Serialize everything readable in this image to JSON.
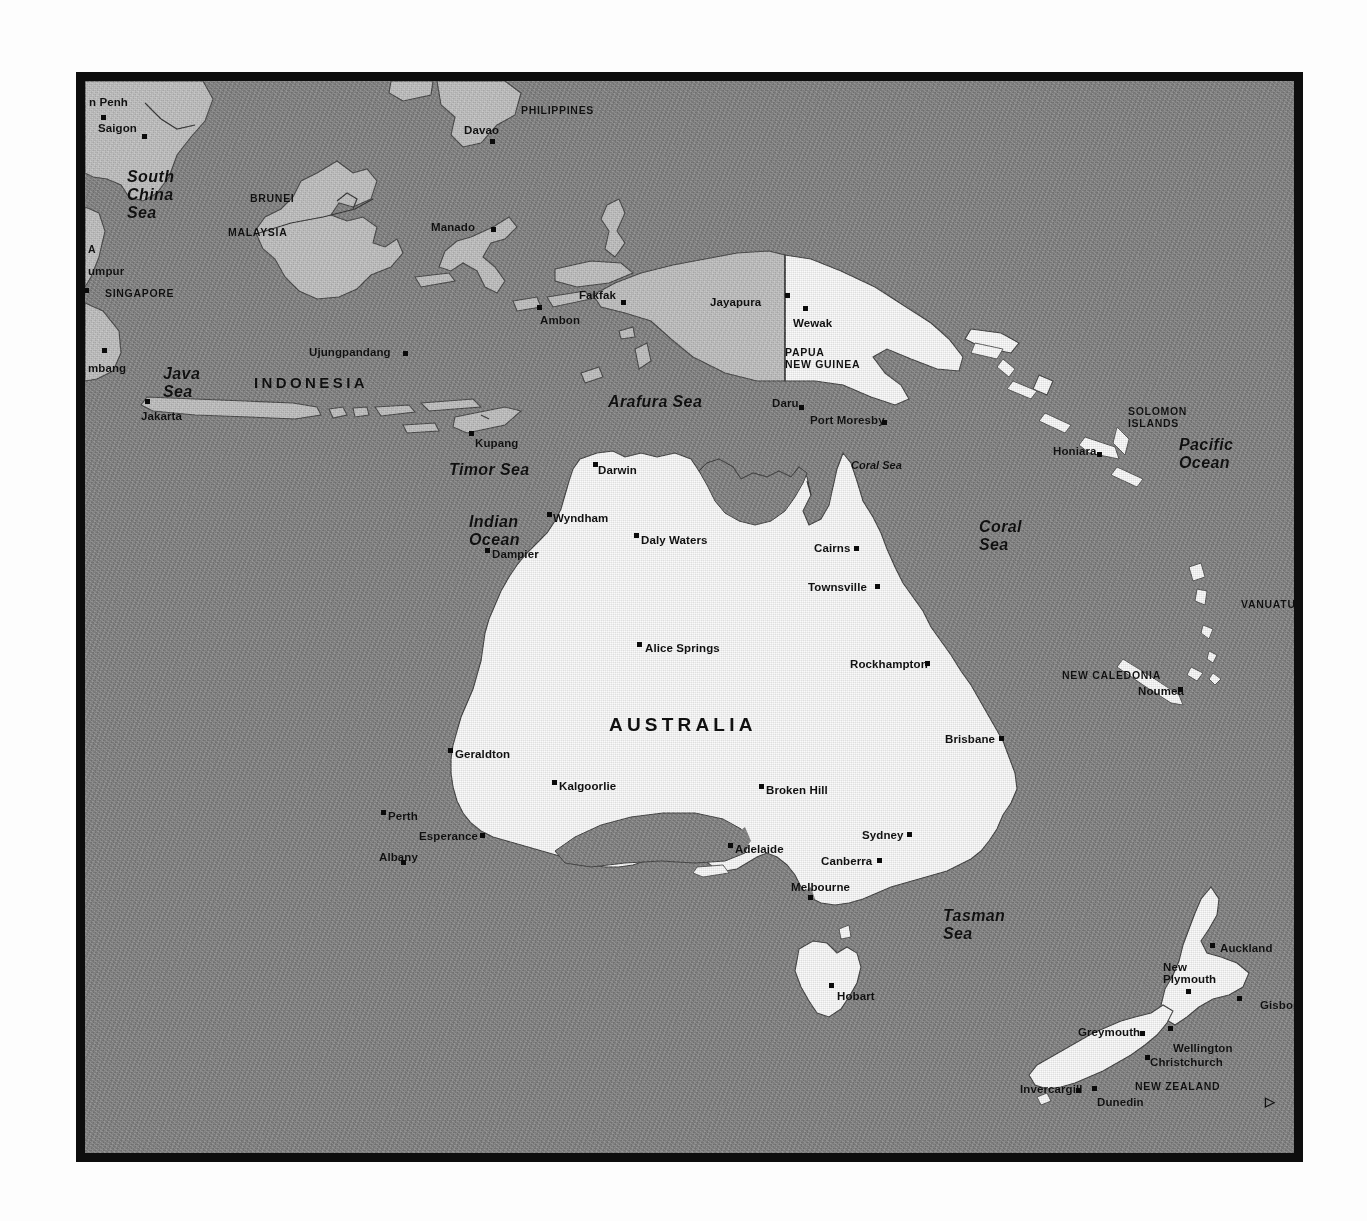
{
  "document": {
    "kind": "printed-map",
    "title": "Australia, Indonesia, Papua New Guinea, New Zealand and the South Pacific",
    "page_background": "#fdfdfd",
    "frame_color": "#0d0d0d",
    "ocean_color": "#898989",
    "land_white_color": "#fbfbfb",
    "land_gray_color": "#c3c3c3"
  },
  "map": {
    "countries": [
      {
        "name": "PHILIPPINES",
        "x": 436,
        "y": 24,
        "style": "country-sm"
      },
      {
        "name": "BRUNEI",
        "x": 165,
        "y": 112,
        "style": "country-sm"
      },
      {
        "name": "MALAYSIA",
        "x": 143,
        "y": 146,
        "style": "country-sm"
      },
      {
        "name": "SINGAPORE",
        "x": 20,
        "y": 207,
        "style": "country-sm"
      },
      {
        "name": "INDONESIA",
        "x": 169,
        "y": 294,
        "style": "country-mid"
      },
      {
        "name": "PAPUA NEW GUINEA",
        "x": 700,
        "y": 266,
        "style": "country-sm multiline",
        "lines": [
          "PAPUA",
          "NEW GUINEA"
        ]
      },
      {
        "name": "SOLOMON ISLANDS",
        "x": 1043,
        "y": 325,
        "style": "country-sm multiline",
        "lines": [
          "SOLOMON",
          "ISLANDS"
        ]
      },
      {
        "name": "VANUATU",
        "x": 1156,
        "y": 518,
        "style": "country-sm"
      },
      {
        "name": "NEW CALEDONIA",
        "x": 977,
        "y": 589,
        "style": "country-sm"
      },
      {
        "name": "AUSTRALIA",
        "x": 524,
        "y": 634,
        "style": "country-big"
      },
      {
        "name": "NEW ZEALAND",
        "x": 1050,
        "y": 1000,
        "style": "country-sm"
      }
    ],
    "seas": [
      {
        "name": "South China Sea",
        "lines": [
          "South",
          "China",
          "Sea"
        ],
        "x": 42,
        "y": 87,
        "style": "sea multiline"
      },
      {
        "name": "Java Sea",
        "lines": [
          "Java",
          "Sea"
        ],
        "x": 78,
        "y": 284,
        "style": "sea multiline"
      },
      {
        "name": "Arafura Sea",
        "lines": [
          "Arafura Sea"
        ],
        "x": 523,
        "y": 313,
        "style": "sea"
      },
      {
        "name": "Pacific Ocean",
        "lines": [
          "Pacific",
          "Ocean"
        ],
        "x": 1094,
        "y": 355,
        "style": "sea multiline"
      },
      {
        "name": "Timor Sea",
        "lines": [
          "Timor Sea"
        ],
        "x": 364,
        "y": 381,
        "style": "sea"
      },
      {
        "name": "Indian Ocean",
        "lines": [
          "Indian",
          "Ocean"
        ],
        "x": 384,
        "y": 432,
        "style": "sea multiline"
      },
      {
        "name": "Coral Sea small",
        "lines": [
          "Coral Sea"
        ],
        "x": 766,
        "y": 379,
        "style": "sea-sm"
      },
      {
        "name": "Coral Sea",
        "lines": [
          "Coral",
          "Sea"
        ],
        "x": 894,
        "y": 437,
        "style": "sea multiline"
      },
      {
        "name": "Tasman Sea",
        "lines": [
          "Tasman",
          "Sea"
        ],
        "x": 858,
        "y": 826,
        "style": "sea multiline"
      }
    ],
    "cities": [
      {
        "name": "Phnom Penh",
        "label": "n Penh",
        "lx": 4,
        "ly": 16,
        "dx": 16,
        "dy": 34,
        "align": "left"
      },
      {
        "name": "Saigon",
        "label": "Saigon",
        "lx": 13,
        "ly": 42,
        "dx": 57,
        "dy": 53,
        "align": "left"
      },
      {
        "name": "Kuala Lumpur",
        "label": "umpur",
        "lx": 3,
        "ly": 185,
        "dx": -1,
        "dy": 207,
        "align": "left"
      },
      {
        "name": "Palembang",
        "label": "mbang",
        "lx": 3,
        "ly": 282,
        "dx": 17,
        "dy": 267,
        "align": "left"
      },
      {
        "name": "Davao",
        "label": "Davao",
        "lx": 379,
        "ly": 44,
        "dx": 405,
        "dy": 58,
        "align": "left"
      },
      {
        "name": "Manado",
        "label": "Manado",
        "lx": 346,
        "ly": 141,
        "dx": 406,
        "dy": 146,
        "align": "left"
      },
      {
        "name": "Ujungpandang",
        "label": "Ujungpandang",
        "lx": 224,
        "ly": 266,
        "dx": 318,
        "dy": 270,
        "align": "left"
      },
      {
        "name": "Jakarta",
        "label": "Jakarta",
        "lx": 56,
        "ly": 330,
        "dx": 60,
        "dy": 318,
        "align": "left"
      },
      {
        "name": "Fakfak",
        "label": "Fakfak",
        "lx": 494,
        "ly": 209,
        "dx": 536,
        "dy": 219,
        "align": "left"
      },
      {
        "name": "Ambon",
        "label": "Ambon",
        "lx": 455,
        "ly": 234,
        "dx": 452,
        "dy": 224,
        "align": "left"
      },
      {
        "name": "Jayapura",
        "label": "Jayapura",
        "lx": 625,
        "ly": 216,
        "dx": 700,
        "dy": 212,
        "align": "left"
      },
      {
        "name": "Wewak",
        "label": "Wewak",
        "lx": 708,
        "ly": 237,
        "dx": 718,
        "dy": 225,
        "align": "left"
      },
      {
        "name": "Daru",
        "label": "Daru",
        "lx": 687,
        "ly": 317,
        "dx": 714,
        "dy": 324,
        "align": "left"
      },
      {
        "name": "Port Moresby",
        "label": "Port Moresby",
        "lx": 725,
        "ly": 334,
        "dx": 797,
        "dy": 339,
        "align": "left"
      },
      {
        "name": "Honiara",
        "label": "Honiara",
        "lx": 968,
        "ly": 365,
        "dx": 1012,
        "dy": 371,
        "align": "left"
      },
      {
        "name": "Noumea",
        "label": "Noumea",
        "lx": 1053,
        "ly": 605,
        "dx": 1093,
        "dy": 606,
        "align": "left"
      },
      {
        "name": "Kupang",
        "label": "Kupang",
        "lx": 390,
        "ly": 357,
        "dx": 384,
        "dy": 350,
        "align": "left"
      },
      {
        "name": "Darwin",
        "label": "Darwin",
        "lx": 513,
        "ly": 384,
        "dx": 508,
        "dy": 381,
        "align": "left"
      },
      {
        "name": "Wyndham",
        "label": "Wyndham",
        "lx": 468,
        "ly": 432,
        "dx": 462,
        "dy": 431,
        "align": "left"
      },
      {
        "name": "Daly Waters",
        "label": "Daly Waters",
        "lx": 556,
        "ly": 454,
        "dx": 549,
        "dy": 452,
        "align": "left"
      },
      {
        "name": "Dampier",
        "label": "Dampier",
        "lx": 407,
        "ly": 468,
        "dx": 400,
        "dy": 467,
        "align": "left"
      },
      {
        "name": "Cairns",
        "label": "Cairns",
        "lx": 729,
        "ly": 462,
        "dx": 769,
        "dy": 465,
        "align": "left"
      },
      {
        "name": "Townsville",
        "label": "Townsville",
        "lx": 723,
        "ly": 501,
        "dx": 790,
        "dy": 503,
        "align": "left"
      },
      {
        "name": "Alice Springs",
        "label": "Alice Springs",
        "lx": 560,
        "ly": 562,
        "dx": 552,
        "dy": 561,
        "align": "left"
      },
      {
        "name": "Rockhampton",
        "label": "Rockhampton",
        "lx": 765,
        "ly": 578,
        "dx": 840,
        "dy": 580,
        "align": "left"
      },
      {
        "name": "Brisbane",
        "label": "Brisbane",
        "lx": 860,
        "ly": 653,
        "dx": 914,
        "dy": 655,
        "align": "left"
      },
      {
        "name": "Geraldton",
        "label": "Geraldton",
        "lx": 370,
        "ly": 668,
        "dx": 363,
        "dy": 667,
        "align": "left"
      },
      {
        "name": "Kalgoorlie",
        "label": "Kalgoorlie",
        "lx": 474,
        "ly": 700,
        "dx": 467,
        "dy": 699,
        "align": "left"
      },
      {
        "name": "Broken Hill",
        "label": "Broken Hill",
        "lx": 681,
        "ly": 704,
        "dx": 674,
        "dy": 703,
        "align": "left"
      },
      {
        "name": "Perth",
        "label": "Perth",
        "lx": 303,
        "ly": 730,
        "dx": 296,
        "dy": 729,
        "align": "left"
      },
      {
        "name": "Esperance",
        "label": "Esperance",
        "lx": 334,
        "ly": 750,
        "dx": 395,
        "dy": 752,
        "align": "left"
      },
      {
        "name": "Albany",
        "label": "Albany",
        "lx": 294,
        "ly": 771,
        "dx": 316,
        "dy": 779,
        "align": "left"
      },
      {
        "name": "Adelaide",
        "label": "Adelaide",
        "lx": 650,
        "ly": 763,
        "dx": 643,
        "dy": 762,
        "align": "left"
      },
      {
        "name": "Sydney",
        "label": "Sydney",
        "lx": 777,
        "ly": 749,
        "dx": 822,
        "dy": 751,
        "align": "left"
      },
      {
        "name": "Canberra",
        "label": "Canberra",
        "lx": 736,
        "ly": 775,
        "dx": 792,
        "dy": 777,
        "align": "left"
      },
      {
        "name": "Melbourne",
        "label": "Melbourne",
        "lx": 706,
        "ly": 801,
        "dx": 723,
        "dy": 814,
        "align": "left"
      },
      {
        "name": "Hobart",
        "label": "Hobart",
        "lx": 752,
        "ly": 910,
        "dx": 744,
        "dy": 902,
        "align": "left"
      },
      {
        "name": "Auckland",
        "label": "Auckland",
        "lx": 1135,
        "ly": 862,
        "dx": 1125,
        "dy": 862,
        "align": "left"
      },
      {
        "name": "New Plymouth",
        "label": "New Plymouth",
        "lx": 1078,
        "ly": 881,
        "dx": 1101,
        "dy": 908,
        "align": "left",
        "lines": [
          "New",
          "Plymouth"
        ]
      },
      {
        "name": "Gisborne",
        "label": "Gisborne",
        "lx": 1175,
        "ly": 919,
        "dx": 1152,
        "dy": 915,
        "align": "left"
      },
      {
        "name": "Greymouth",
        "label": "Greymouth",
        "lx": 993,
        "ly": 946,
        "dx": 1055,
        "dy": 950,
        "align": "left"
      },
      {
        "name": "Wellington",
        "label": "Wellington",
        "lx": 1088,
        "ly": 962,
        "dx": 1083,
        "dy": 945,
        "align": "left"
      },
      {
        "name": "Christchurch",
        "label": "Christchurch",
        "lx": 1065,
        "ly": 976,
        "dx": 1060,
        "dy": 974,
        "align": "left"
      },
      {
        "name": "Invercargill",
        "label": "Invercargill",
        "lx": 935,
        "ly": 1003,
        "dx": 991,
        "dy": 1007,
        "align": "left"
      },
      {
        "name": "Dunedin",
        "label": "Dunedin",
        "lx": 1012,
        "ly": 1016,
        "dx": 1007,
        "dy": 1005,
        "align": "left"
      }
    ],
    "edge_clipped_labels": [
      {
        "name": "A",
        "x": 3,
        "y": 163
      }
    ],
    "corner_mark": {
      "glyph": "▷",
      "x": 1180,
      "y": 1013
    }
  }
}
